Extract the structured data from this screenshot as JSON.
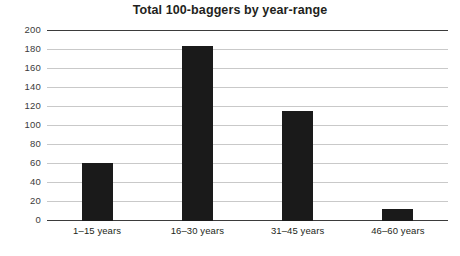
{
  "chart_data": {
    "type": "bar",
    "title": "Total 100-baggers by year-range",
    "xlabel": "",
    "ylabel": "",
    "categories": [
      "1–15 years",
      "16–30 years",
      "31–45 years",
      "46–60 years"
    ],
    "values": [
      61,
      184,
      116,
      13
    ],
    "ylim": [
      0,
      200
    ],
    "yticks": [
      0,
      20,
      40,
      60,
      80,
      100,
      120,
      140,
      160,
      180,
      200
    ],
    "ytick_labels": [
      "0",
      "20",
      "40",
      "60",
      "80",
      "100",
      "120",
      "140",
      "160",
      "180",
      "200"
    ],
    "grid": true,
    "legend": false,
    "legend_position": "none",
    "series": [
      {
        "name": "Total 100-baggers",
        "values": [
          61,
          184,
          116,
          13
        ]
      }
    ],
    "colors": {
      "bar": "#1a1a1a",
      "gridline": "#c9c9c9",
      "axis": "#3b3b3b",
      "title_text": "#231f20",
      "tick_text": "#3b3b3b",
      "background": "#ffffff"
    }
  }
}
